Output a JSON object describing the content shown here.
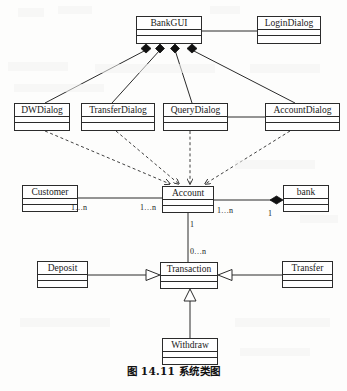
{
  "figure": {
    "caption": "图 14.11  系统类图",
    "type": "uml-class-diagram"
  },
  "classes": [
    {
      "id": "bankgui",
      "name": "BankGUI",
      "x": 136,
      "y": 16,
      "w": 66,
      "h": 28
    },
    {
      "id": "logindialog",
      "name": "LoginDialog",
      "x": 257,
      "y": 16,
      "w": 64,
      "h": 28
    },
    {
      "id": "dwdialog",
      "name": "DWDialog",
      "x": 14,
      "y": 103,
      "w": 56,
      "h": 28
    },
    {
      "id": "transferdialog",
      "name": "TransferDialog",
      "x": 81,
      "y": 103,
      "w": 74,
      "h": 28
    },
    {
      "id": "querydialog",
      "name": "QueryDialog",
      "x": 163,
      "y": 103,
      "w": 65,
      "h": 28
    },
    {
      "id": "accountdialog",
      "name": "AccountDialog",
      "x": 265,
      "y": 103,
      "w": 75,
      "h": 28
    },
    {
      "id": "customer",
      "name": "Customer",
      "x": 22,
      "y": 185,
      "w": 56,
      "h": 27
    },
    {
      "id": "account",
      "name": "Account",
      "x": 162,
      "y": 186,
      "w": 52,
      "h": 27
    },
    {
      "id": "bank",
      "name": "bank",
      "x": 283,
      "y": 185,
      "w": 46,
      "h": 27
    },
    {
      "id": "deposit",
      "name": "Deposit",
      "x": 37,
      "y": 261,
      "w": 51,
      "h": 27
    },
    {
      "id": "transaction",
      "name": "Transaction",
      "x": 160,
      "y": 262,
      "w": 58,
      "h": 27
    },
    {
      "id": "transfer",
      "name": "Transfer",
      "x": 282,
      "y": 261,
      "w": 51,
      "h": 27
    },
    {
      "id": "withdraw",
      "name": "Withdraw",
      "x": 162,
      "y": 338,
      "w": 56,
      "h": 27
    }
  ],
  "multiplicities": [
    {
      "id": "customer-to-account",
      "label": "1…n",
      "x": 71,
      "y": 203
    },
    {
      "id": "account-left",
      "label": "1…n",
      "x": 140,
      "y": 203
    },
    {
      "id": "account-right",
      "label": "1…n",
      "x": 217,
      "y": 206
    },
    {
      "id": "bank-side",
      "label": "1",
      "x": 268,
      "y": 209
    },
    {
      "id": "account-to-transaction",
      "label": "1",
      "x": 190,
      "y": 221
    },
    {
      "id": "transaction-side",
      "label": "0…n",
      "x": 190,
      "y": 248
    }
  ],
  "relationships": [
    {
      "id": "bankgui-logindialog",
      "type": "association",
      "from": "bankgui",
      "to": "logindialog"
    },
    {
      "id": "bankgui-dwdialog",
      "type": "composition",
      "from": "bankgui",
      "to": "dwdialog"
    },
    {
      "id": "bankgui-transferdialog",
      "type": "composition",
      "from": "bankgui",
      "to": "transferdialog"
    },
    {
      "id": "bankgui-querydialog",
      "type": "composition",
      "from": "bankgui",
      "to": "querydialog"
    },
    {
      "id": "bankgui-accountdialog",
      "type": "composition",
      "from": "bankgui",
      "to": "accountdialog"
    },
    {
      "id": "dwdialog-account",
      "type": "dependency",
      "from": "dwdialog",
      "to": "account"
    },
    {
      "id": "transferdialog-account",
      "type": "dependency",
      "from": "transferdialog",
      "to": "account"
    },
    {
      "id": "querydialog-account",
      "type": "dependency",
      "from": "querydialog",
      "to": "account"
    },
    {
      "id": "accountdialog-account",
      "type": "dependency",
      "from": "accountdialog",
      "to": "account"
    },
    {
      "id": "querydialog-accountdialog",
      "type": "association",
      "from": "querydialog",
      "to": "accountdialog"
    },
    {
      "id": "customer-account",
      "type": "association",
      "from": "customer",
      "to": "account"
    },
    {
      "id": "account-bank",
      "type": "composition",
      "from": "account",
      "to": "bank"
    },
    {
      "id": "account-transaction",
      "type": "association",
      "from": "account",
      "to": "transaction"
    },
    {
      "id": "deposit-transaction",
      "type": "generalization",
      "from": "deposit",
      "to": "transaction"
    },
    {
      "id": "transfer-transaction",
      "type": "generalization",
      "from": "transfer",
      "to": "transaction"
    },
    {
      "id": "withdraw-transaction",
      "type": "generalization",
      "from": "withdraw",
      "to": "transaction"
    }
  ],
  "colors": {
    "stroke": "#2b2b2b",
    "fill": "#ffffff",
    "text": "#1a1a1a",
    "background": "#fdfdfc"
  }
}
